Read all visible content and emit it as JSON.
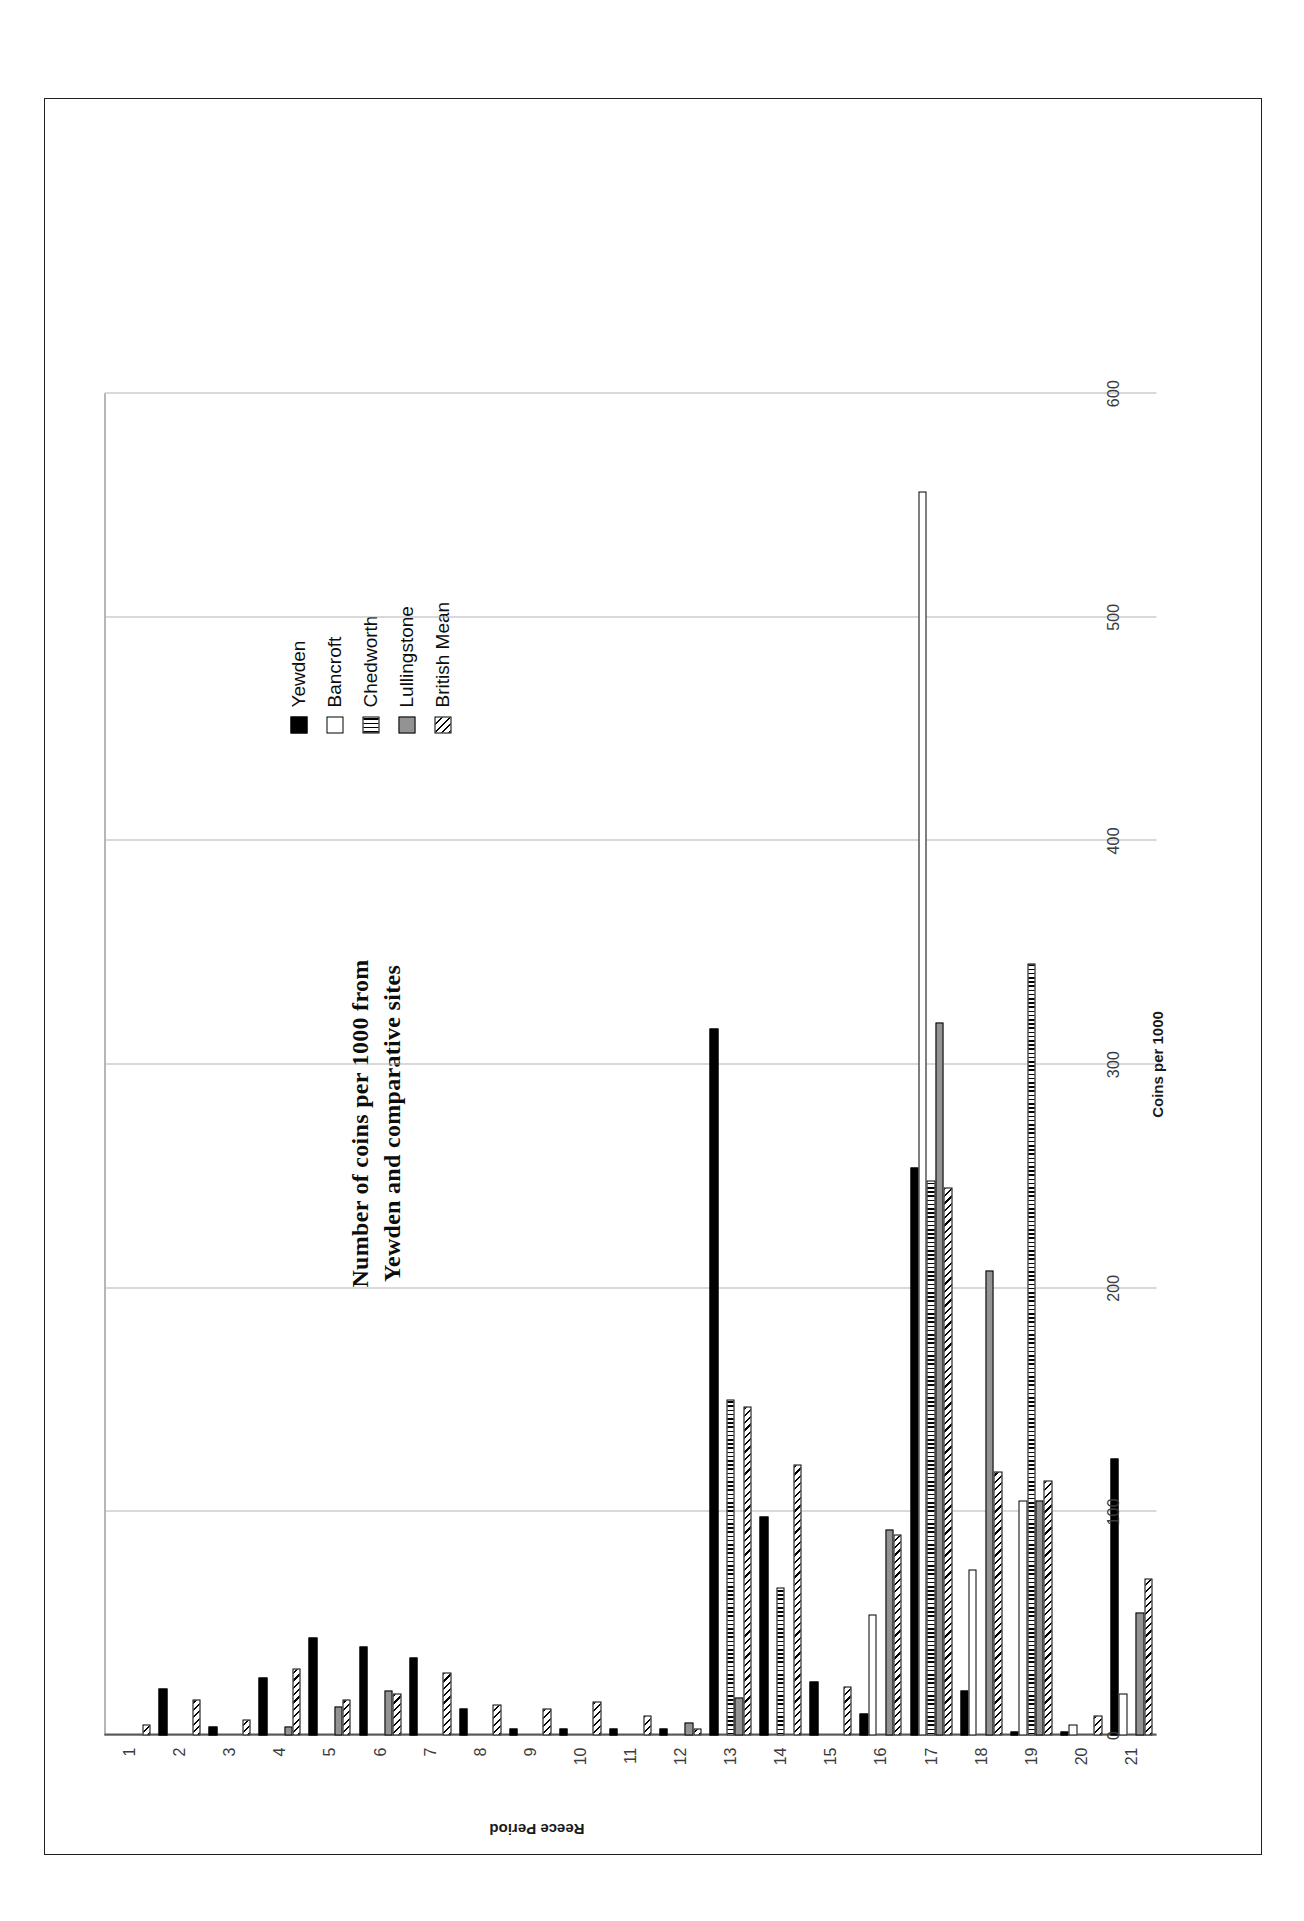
{
  "figure": {
    "title_line1": "Number of coins per 1000 from",
    "title_line2": "Yewden and comparative sites"
  },
  "axes": {
    "value_axis_title": "Coins per 1000",
    "category_axis_title": "Reece Period",
    "value_ticks": [
      "0",
      "100",
      "200",
      "300",
      "400",
      "500",
      "600"
    ],
    "category_ticks": [
      "1",
      "2",
      "3",
      "4",
      "5",
      "6",
      "7",
      "8",
      "9",
      "10",
      "11",
      "12",
      "13",
      "14",
      "15",
      "16",
      "17",
      "18",
      "19",
      "20",
      "21"
    ]
  },
  "legend": {
    "items": [
      {
        "label": "Yewden",
        "swatch": "solid-black-swatch",
        "color": "#000000"
      },
      {
        "label": "Bancroft",
        "swatch": "outline-white-swatch",
        "color": "#ffffff"
      },
      {
        "label": "Chedworth",
        "swatch": "vertical-stripe-swatch",
        "color": "#000000"
      },
      {
        "label": "Lullingstone",
        "swatch": "solid-gray-swatch",
        "color": "#939393"
      },
      {
        "label": "British Mean",
        "swatch": "diagonal-hatch-swatch",
        "color": "#000000"
      }
    ]
  },
  "chart_data": {
    "type": "bar",
    "orientation": "horizontal",
    "title": "Number of coins per 1000 from Yewden and comparative sites",
    "xlabel": "Coins per 1000",
    "ylabel": "Reece Period",
    "xlim": [
      0,
      600
    ],
    "grid": true,
    "legend_position": "top-right",
    "categories": [
      "1",
      "2",
      "3",
      "4",
      "5",
      "6",
      "7",
      "8",
      "9",
      "10",
      "11",
      "12",
      "13",
      "14",
      "15",
      "16",
      "17",
      "18",
      "19",
      "20",
      "21"
    ],
    "series": [
      {
        "name": "Yewden",
        "values": [
          0,
          21,
          4,
          26,
          44,
          40,
          35,
          12,
          3,
          3,
          3,
          3,
          316,
          98,
          24,
          10,
          254,
          20,
          2,
          2,
          124
        ]
      },
      {
        "name": "Bancroft",
        "values": [
          0,
          0,
          0,
          0,
          0,
          0,
          0,
          0,
          0,
          0,
          0,
          0,
          0,
          0,
          0,
          54,
          556,
          74,
          105,
          5,
          19
        ]
      },
      {
        "name": "Chedworth",
        "values": [
          0,
          0,
          0,
          0,
          0,
          0,
          0,
          0,
          0,
          0,
          0,
          0,
          150,
          66,
          0,
          0,
          248,
          0,
          345,
          0,
          0
        ]
      },
      {
        "name": "Lullingstone",
        "values": [
          0,
          0,
          0,
          4,
          13,
          20,
          0,
          0,
          0,
          0,
          0,
          6,
          17,
          0,
          0,
          92,
          319,
          208,
          105,
          0,
          55
        ]
      },
      {
        "name": "British Mean",
        "values": [
          5,
          16,
          7,
          30,
          16,
          19,
          28,
          14,
          12,
          15,
          9,
          3,
          147,
          121,
          22,
          90,
          245,
          118,
          114,
          9,
          70
        ]
      }
    ]
  }
}
